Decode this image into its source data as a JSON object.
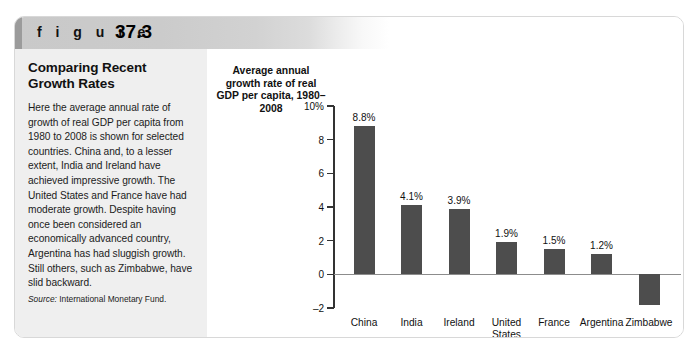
{
  "figure": {
    "label": "f i g u r e",
    "number": "37.3"
  },
  "panel": {
    "title": "Comparing Recent Growth Rates",
    "body": "Here the average annual rate of growth of real GDP per capita from 1980 to 2008 is shown for selected countries. China and, to a lesser extent, India and Ireland have achieved impressive growth. The United States and France have had moderate growth. Despite having once been considered an economically advanced country, Argentina has had sluggish growth. Still others, such as Zimbabwe, have slid backward.",
    "source_word": "Source:",
    "source_text": "International Monetary Fund."
  },
  "chart_data": {
    "type": "bar",
    "title": "Average annual growth rate of real GDP per capita, 1980–2008",
    "xlabel": "",
    "ylabel": "Average annual growth rate of real GDP per capita, 1980–2008",
    "ylim": [
      -2,
      10
    ],
    "grid": false,
    "legend": "none",
    "categories": [
      "China",
      "India",
      "Ireland",
      "United\nStates",
      "France",
      "Argentina",
      "Zimbabwe"
    ],
    "values": [
      8.8,
      4.1,
      3.9,
      1.9,
      1.5,
      1.2,
      -1.8
    ],
    "value_labels": [
      "8.8%",
      "4.1%",
      "3.9%",
      "1.9%",
      "1.5%",
      "1.2%",
      "–1.8%"
    ],
    "y_ticks": [
      10,
      8,
      6,
      4,
      2,
      0,
      -2
    ],
    "y_tick_labels": [
      "10%",
      "8",
      "6",
      "4",
      "2",
      "0",
      "–2"
    ],
    "bar_color": "#4d4d4d",
    "axis_color": "#333333"
  }
}
